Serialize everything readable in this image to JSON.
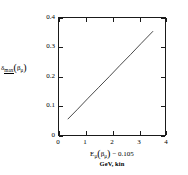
{
  "chart_data": {
    "type": "line",
    "title": "",
    "subtitle": "",
    "xlabel_main": "E",
    "xlabel_full": "Eμ(βμ) − 0.105",
    "xlabel_units": "GeV, kin",
    "ylabel_full": "δmax(βμ)",
    "xlim": [
      0,
      4
    ],
    "ylim": [
      0,
      0.4
    ],
    "xticks": [
      "0",
      "1",
      "2",
      "3",
      "4"
    ],
    "xtick_values": [
      0,
      1,
      2,
      3,
      4
    ],
    "yticks": [
      "0",
      "0.1",
      "0.2",
      "0.3",
      "0.4"
    ],
    "ytick_values": [
      0,
      0.1,
      0.2,
      0.3,
      0.4
    ],
    "grid": false,
    "legend": null,
    "series": [
      {
        "name": "delta_max",
        "color": "#1a1a1a",
        "x": [
          0.33,
          0.7,
          1.1,
          1.5,
          1.9,
          2.3,
          2.7,
          3.1,
          3.55
        ],
        "y": [
          0.054,
          0.088,
          0.126,
          0.163,
          0.2,
          0.238,
          0.275,
          0.313,
          0.355
        ]
      }
    ],
    "annotations": []
  },
  "axis": {
    "x_title_line1_pre": "E",
    "x_title_line1_sub": "μ",
    "x_title_paren_open": "(",
    "x_title_beta": "β",
    "x_title_beta_sub": "μ",
    "x_title_paren_close": ")",
    "x_title_tail": "− 0.105",
    "x_title_line2": "GeV, kin",
    "y_title_delta": "δ",
    "y_title_max": "max",
    "y_title_paren_open": "(",
    "y_title_beta": "β",
    "y_title_beta_sub": "μ",
    "y_title_paren_close": ")"
  },
  "colors": {
    "line": "#1a1a1a",
    "frame": "#1a1a1a",
    "background": "#ffffff",
    "text": "#000000"
  }
}
